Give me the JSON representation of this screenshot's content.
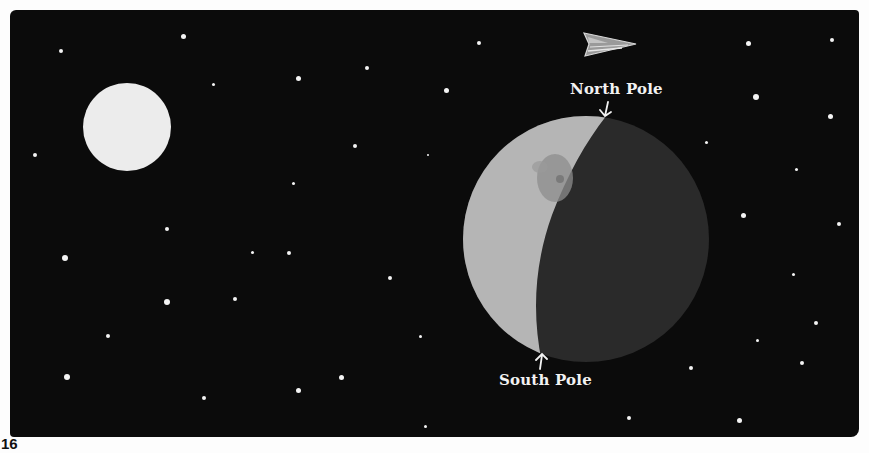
{
  "illustration": {
    "background_color": "#0b0b0b",
    "sun_color": "#ececec",
    "moon": {
      "lit_color": "#b5b5b5",
      "dark_color": "#2a2a2a",
      "mare_color": "#8e8e8e"
    },
    "labels": {
      "north_pole": "North Pole",
      "south_pole": "South Pole"
    },
    "arrows": {
      "north_pole": "down-arrow",
      "south_pole": "up-arrow"
    },
    "spaceship": "spaceship-icon"
  },
  "footer": {
    "page_number": "16"
  },
  "stars": [
    {
      "x": 61,
      "y": 51,
      "r": 2
    },
    {
      "x": 183,
      "y": 36,
      "r": 2.5
    },
    {
      "x": 213,
      "y": 84,
      "r": 1.5
    },
    {
      "x": 298,
      "y": 78,
      "r": 2.5
    },
    {
      "x": 367,
      "y": 68,
      "r": 2
    },
    {
      "x": 355,
      "y": 146,
      "r": 2
    },
    {
      "x": 35,
      "y": 155,
      "r": 2
    },
    {
      "x": 293,
      "y": 183,
      "r": 1.5
    },
    {
      "x": 428,
      "y": 155,
      "r": 1.2
    },
    {
      "x": 479,
      "y": 43,
      "r": 2
    },
    {
      "x": 446,
      "y": 90,
      "r": 2.5
    },
    {
      "x": 167,
      "y": 229,
      "r": 2
    },
    {
      "x": 65,
      "y": 258,
      "r": 3
    },
    {
      "x": 252,
      "y": 252,
      "r": 1.5
    },
    {
      "x": 289,
      "y": 253,
      "r": 2
    },
    {
      "x": 235,
      "y": 299,
      "r": 2
    },
    {
      "x": 167,
      "y": 302,
      "r": 3
    },
    {
      "x": 108,
      "y": 336,
      "r": 2
    },
    {
      "x": 390,
      "y": 278,
      "r": 2
    },
    {
      "x": 341,
      "y": 377,
      "r": 2.5
    },
    {
      "x": 420,
      "y": 336,
      "r": 1.5
    },
    {
      "x": 67,
      "y": 377,
      "r": 3
    },
    {
      "x": 204,
      "y": 398,
      "r": 2
    },
    {
      "x": 298,
      "y": 390,
      "r": 2.5
    },
    {
      "x": 425,
      "y": 426,
      "r": 1.5
    },
    {
      "x": 748,
      "y": 43,
      "r": 2.5
    },
    {
      "x": 832,
      "y": 40,
      "r": 2
    },
    {
      "x": 756,
      "y": 97,
      "r": 3
    },
    {
      "x": 830,
      "y": 116,
      "r": 2.5
    },
    {
      "x": 706,
      "y": 142,
      "r": 1.5
    },
    {
      "x": 796,
      "y": 169,
      "r": 1.5
    },
    {
      "x": 743,
      "y": 215,
      "r": 2.5
    },
    {
      "x": 839,
      "y": 224,
      "r": 2
    },
    {
      "x": 793,
      "y": 274,
      "r": 1.5
    },
    {
      "x": 816,
      "y": 323,
      "r": 2
    },
    {
      "x": 757,
      "y": 340,
      "r": 1.5
    },
    {
      "x": 802,
      "y": 363,
      "r": 2
    },
    {
      "x": 691,
      "y": 368,
      "r": 2
    },
    {
      "x": 739,
      "y": 420,
      "r": 2.5
    },
    {
      "x": 629,
      "y": 418,
      "r": 2
    }
  ]
}
